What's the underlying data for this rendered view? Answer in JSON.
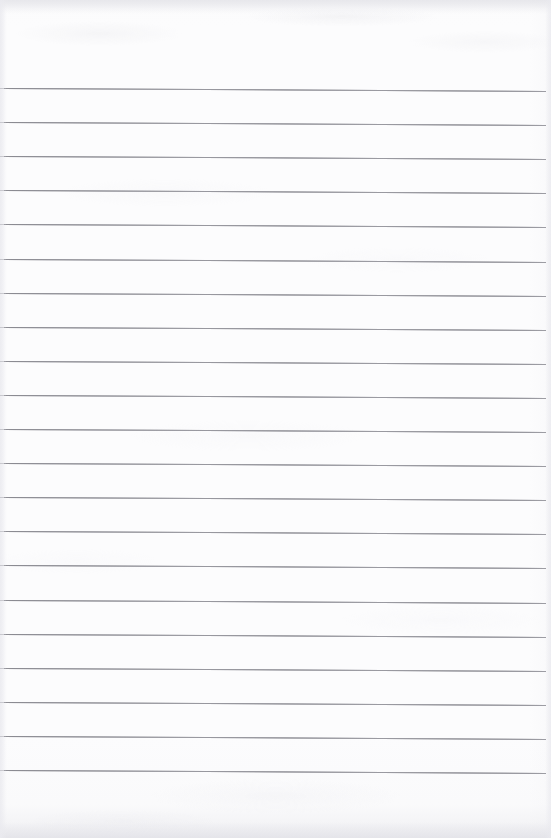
{
  "document": {
    "type": "scanned-lined-paper",
    "title": "Blank Lined Notepad Page",
    "content_text": "",
    "is_blank": true,
    "width_px": 551,
    "height_px": 838
  },
  "paper": {
    "background_color": "#fcfcfd",
    "edge_shadow_color": "#e7e7eb",
    "grain_visible": true
  },
  "ruling": {
    "line_color": "#8e8e95",
    "line_thickness_px": 1,
    "line_count": 21,
    "first_line_y": 88,
    "line_spacing_px": 34.1,
    "line_start_x": 4,
    "line_end_x": 546,
    "skew_px_over_width": 3,
    "top_margin_px": 88,
    "bottom_margin_px": 68,
    "lines": [
      {
        "index": 1,
        "y": 88,
        "text": ""
      },
      {
        "index": 2,
        "y": 122.1,
        "text": ""
      },
      {
        "index": 3,
        "y": 156.2,
        "text": ""
      },
      {
        "index": 4,
        "y": 190.3,
        "text": ""
      },
      {
        "index": 5,
        "y": 224.4,
        "text": ""
      },
      {
        "index": 6,
        "y": 258.5,
        "text": ""
      },
      {
        "index": 7,
        "y": 292.6,
        "text": ""
      },
      {
        "index": 8,
        "y": 326.7,
        "text": ""
      },
      {
        "index": 9,
        "y": 360.8,
        "text": ""
      },
      {
        "index": 10,
        "y": 394.9,
        "text": ""
      },
      {
        "index": 11,
        "y": 429.0,
        "text": ""
      },
      {
        "index": 12,
        "y": 463.1,
        "text": ""
      },
      {
        "index": 13,
        "y": 497.2,
        "text": ""
      },
      {
        "index": 14,
        "y": 531.3,
        "text": ""
      },
      {
        "index": 15,
        "y": 565.4,
        "text": ""
      },
      {
        "index": 16,
        "y": 599.5,
        "text": ""
      },
      {
        "index": 17,
        "y": 633.6,
        "text": ""
      },
      {
        "index": 18,
        "y": 667.7,
        "text": ""
      },
      {
        "index": 19,
        "y": 701.8,
        "text": ""
      },
      {
        "index": 20,
        "y": 735.9,
        "text": ""
      },
      {
        "index": 21,
        "y": 770.0,
        "text": ""
      }
    ]
  }
}
